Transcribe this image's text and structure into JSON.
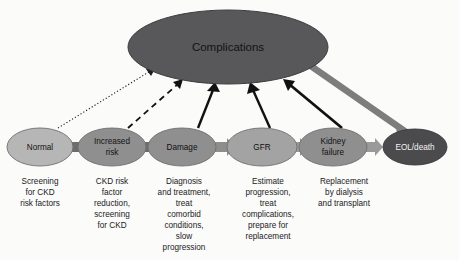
{
  "figure": {
    "background_color": "#fbfbfa"
  },
  "hub": {
    "label": "Complications",
    "fill": "#58585a",
    "stroke": "#3d3d3f",
    "text_color": "#121212"
  },
  "stages": [
    {
      "id": "normal",
      "label": "Normal",
      "label_lines": [
        "Normal"
      ],
      "fill": "#b6b6b6",
      "text_color": "#111111",
      "caption_lines": [
        "Screening",
        "for CKD",
        "risk factors"
      ],
      "arrow_to_hub": "dotted"
    },
    {
      "id": "increased-risk",
      "label": "Increased risk",
      "label_lines": [
        "Increased",
        "risk"
      ],
      "fill": "#8f8f8f",
      "text_color": "#111111",
      "caption_lines": [
        "CKD risk",
        "factor",
        "reduction,",
        "screening",
        "for CKD"
      ],
      "arrow_to_hub": "dashed"
    },
    {
      "id": "damage",
      "label": "Damage",
      "label_lines": [
        "Damage"
      ],
      "fill": "#8f8f8f",
      "text_color": "#111111",
      "caption_lines": [
        "Diagnosis",
        "and treatment,",
        "treat",
        "comorbid",
        "conditions,",
        "slow",
        "progression"
      ],
      "arrow_to_hub": "solid"
    },
    {
      "id": "gfr",
      "label": "GFR",
      "label_lines": [
        "GFR"
      ],
      "fill": "#a3a3a3",
      "text_color": "#111111",
      "caption_lines": [
        "Estimate",
        "progression,",
        "treat",
        "complications,",
        "prepare for",
        "replacement"
      ],
      "arrow_to_hub": "solid"
    },
    {
      "id": "kidney-failure",
      "label": "Kidney failure",
      "label_lines": [
        "Kidney",
        "failure"
      ],
      "fill": "#8f8f8f",
      "text_color": "#111111",
      "caption_lines": [
        "Replacement",
        "by dialysis",
        "and transplant"
      ],
      "arrow_to_hub": "solid"
    },
    {
      "id": "eol-death",
      "label": "EOL/death",
      "label_lines": [
        "EOL/death"
      ],
      "fill": "#4b4b4d",
      "text_color": "#f2f2f2",
      "caption_lines": [],
      "arrow_to_hub": "none"
    }
  ],
  "connectors": [
    {
      "from": "normal",
      "to": "increased-risk",
      "fill": "#6d6d6d"
    },
    {
      "from": "increased-risk",
      "to": "damage",
      "fill": "#6d6d6d"
    },
    {
      "from": "damage",
      "to": "gfr",
      "fill": "#8d8d8d"
    },
    {
      "from": "gfr",
      "to": "kidney-failure",
      "fill": "#9a9a9a"
    },
    {
      "from": "kidney-failure",
      "to": "eol-death",
      "fill": "#9a9a9a"
    }
  ],
  "outcome_arrow": {
    "from": "Complications",
    "to": "EOL/death",
    "color": "#7d7d7d",
    "style": "thick-solid"
  },
  "colors": {
    "arrow_black": "#111111",
    "arrow_gray": "#7d7d7d"
  }
}
